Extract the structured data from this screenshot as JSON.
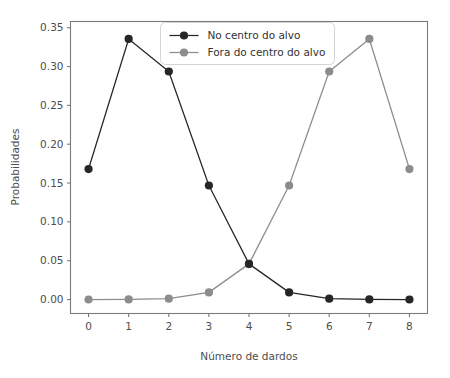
{
  "chart_data": {
    "type": "line",
    "title": "",
    "xlabel": "Número de dardos",
    "ylabel": "Probabilidades",
    "x": [
      0,
      1,
      2,
      3,
      4,
      5,
      6,
      7,
      8
    ],
    "xtick_labels": [
      "0",
      "1",
      "2",
      "3",
      "4",
      "5",
      "6",
      "7",
      "8"
    ],
    "ytick_labels": [
      "0.00",
      "0.05",
      "0.10",
      "0.15",
      "0.20",
      "0.25",
      "0.30",
      "0.35"
    ],
    "yticks": [
      0.0,
      0.05,
      0.1,
      0.15,
      0.2,
      0.25,
      0.3,
      0.35
    ],
    "xlim": [
      -0.45,
      8.45
    ],
    "ylim": [
      -0.018,
      0.358
    ],
    "grid": false,
    "legend_position": "upper center",
    "series": [
      {
        "name": "No centro do alvo",
        "color": "#262626",
        "marker": "circle",
        "values": [
          0.168,
          0.3355,
          0.2936,
          0.1468,
          0.0459,
          0.0092,
          0.0011,
          0.0001,
          0.0
        ]
      },
      {
        "name": "Fora do centro do alvo",
        "color": "#8c8c8c",
        "marker": "circle",
        "values": [
          0.0,
          0.0001,
          0.0011,
          0.0092,
          0.0459,
          0.1468,
          0.2936,
          0.3355,
          0.168
        ]
      }
    ]
  },
  "legend": {
    "entries": [
      {
        "label": "No centro do alvo",
        "color": "#262626"
      },
      {
        "label": "Fora do centro do alvo",
        "color": "#8c8c8c"
      }
    ]
  },
  "axes": {
    "spine_color": "#7a7a7a",
    "tick_label_color": "#4d4d4d"
  }
}
